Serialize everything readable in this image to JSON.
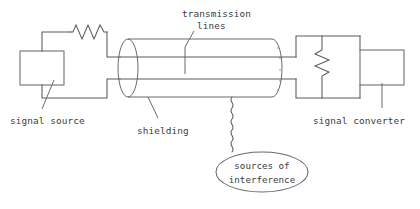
{
  "diagram": {
    "background_color": "#ffffff",
    "line_color": "#5a5a5a",
    "text_color": "#3c3c3c",
    "labels": {
      "transmission_line1": "transmission",
      "transmission_line2": "lines",
      "signal_source": "signal source",
      "shielding": "shielding",
      "signal_converter": "signal converter",
      "interference_line1": "sources of",
      "interference_line2": "interference"
    },
    "components": [
      {
        "name": "signal-source-box",
        "kind": "rectangle"
      },
      {
        "name": "source-series-resistor",
        "kind": "resistor-horizontal"
      },
      {
        "name": "shielding-cylinder",
        "kind": "cylinder"
      },
      {
        "name": "transmission-line-upper",
        "kind": "wire"
      },
      {
        "name": "transmission-line-lower",
        "kind": "wire"
      },
      {
        "name": "termination-resistor",
        "kind": "resistor-vertical"
      },
      {
        "name": "signal-converter-box",
        "kind": "rectangle"
      },
      {
        "name": "interference-ellipse",
        "kind": "ellipse"
      },
      {
        "name": "interference-wave",
        "kind": "squiggle"
      }
    ]
  }
}
